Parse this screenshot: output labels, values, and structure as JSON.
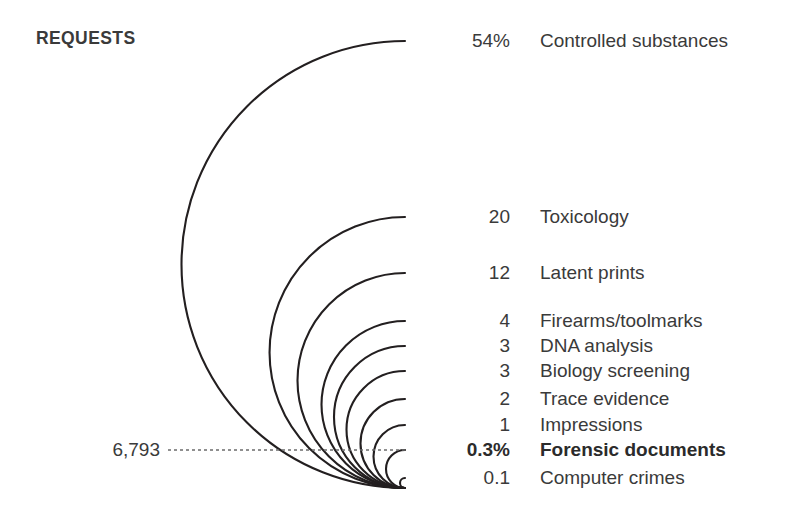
{
  "chart_data": {
    "type": "bar",
    "title": "REQUESTS",
    "subtitle": "",
    "xlabel": "",
    "ylabel": "",
    "grid": false,
    "legend": "none",
    "units": "percent of requests",
    "categories": [
      "Controlled substances",
      "Toxicology",
      "Latent prints",
      "Firearms/toolmarks",
      "DNA analysis",
      "Biology screening",
      "Trace evidence",
      "Impressions",
      "Forensic documents",
      "Computer crimes"
    ],
    "values": [
      54,
      20,
      12,
      4,
      3,
      3,
      2,
      1,
      0.3,
      0.1
    ],
    "value_labels": [
      "54%",
      "20",
      "12",
      "4",
      "3",
      "3",
      "2",
      "1",
      "0.3%",
      "0.1"
    ],
    "annotations": [
      {
        "name": "forensic-documents-count",
        "text": "6,793",
        "attached_to": "Forensic documents",
        "style": "dotted-leader-line"
      }
    ],
    "highlighted_category": "Forensic documents"
  },
  "geometry": {
    "arc_hub_x": 405,
    "arc_hub_y": 488,
    "rows_y": [
      41,
      217,
      273,
      321,
      346,
      371,
      399,
      425,
      450,
      478
    ],
    "leader_line_y": 450,
    "leader_line_x1": 168,
    "leader_line_x2": 405,
    "leader_value_right_x": 160
  },
  "colors": {
    "background": "#ffffff",
    "text": "#3a3a3a",
    "text_bold": "#2b2b2b",
    "arc_stroke": "#231f20",
    "leader_stroke": "#6b6b6b"
  },
  "rows": [
    {
      "value": "54%",
      "label": "Controlled substances",
      "bold": false
    },
    {
      "value": "20",
      "label": "Toxicology",
      "bold": false
    },
    {
      "value": "12",
      "label": "Latent prints",
      "bold": false
    },
    {
      "value": "4",
      "label": "Firearms/toolmarks",
      "bold": false
    },
    {
      "value": "3",
      "label": "DNA analysis",
      "bold": false
    },
    {
      "value": "3",
      "label": "Biology screening",
      "bold": false
    },
    {
      "value": "2",
      "label": "Trace evidence",
      "bold": false
    },
    {
      "value": "1",
      "label": "Impressions",
      "bold": false
    },
    {
      "value": "0.3%",
      "label": "Forensic documents",
      "bold": true
    },
    {
      "value": "0.1",
      "label": "Computer crimes",
      "bold": false
    }
  ],
  "leader": {
    "value": "6,793"
  },
  "title": "REQUESTS"
}
